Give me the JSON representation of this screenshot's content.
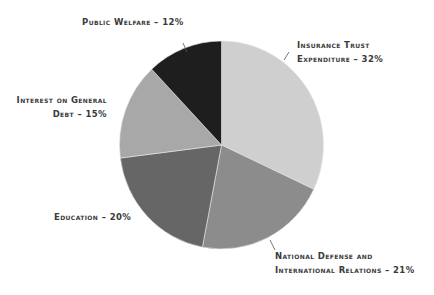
{
  "chart_data": {
    "type": "pie",
    "title": "",
    "start_angle_deg": 0,
    "direction": "clockwise",
    "slices": [
      {
        "label": "Insurance Trust Expenditure",
        "value": 32,
        "color": "#cfcfcf"
      },
      {
        "label": "National Defense and International Relations",
        "value": 21,
        "color": "#8c8c8c"
      },
      {
        "label": "Education",
        "value": 20,
        "color": "#666666"
      },
      {
        "label": "Interest on General Debt",
        "value": 15,
        "color": "#a8a8a8"
      },
      {
        "label": "Public Welfare",
        "value": 12,
        "color": "#1e1e1e"
      }
    ],
    "categories": [
      "Insurance Trust Expenditure",
      "National Defense and International Relations",
      "Education",
      "Interest on General Debt",
      "Public Welfare"
    ],
    "values": [
      32,
      21,
      20,
      15,
      12
    ],
    "unit": "%"
  },
  "labels": {
    "public_welfare": "Public Welfare – 12%",
    "insurance_line1": "Insurance Trust",
    "insurance_line2": "Expenditure – 32%",
    "interest_line1": "Interest on General",
    "interest_line2": "Debt – 15%",
    "education": "Education – 20%",
    "defense_line1": "National Defense and",
    "defense_line2": "International Relations – 21%"
  }
}
